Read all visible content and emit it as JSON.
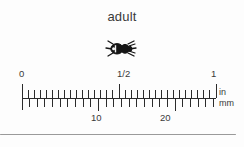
{
  "figure": {
    "title": "adult",
    "specimen_icon": "beetle-icon",
    "background_color": "#fdfdfd",
    "ink_color": "#2b2b2b"
  },
  "ruler": {
    "inch_scale": {
      "unit_label": "in",
      "labels": [
        "0",
        "1/2",
        "1"
      ],
      "label_values": [
        0,
        0.5,
        1
      ],
      "subdivisions_per_inch": 16,
      "range": [
        0,
        1
      ]
    },
    "mm_scale": {
      "unit_label": "mm",
      "labels": [
        "10",
        "20"
      ],
      "label_values": [
        10,
        20
      ],
      "tick_step": 1,
      "range": [
        0,
        26
      ]
    }
  },
  "divider": {
    "color": "#9a9a9a"
  }
}
